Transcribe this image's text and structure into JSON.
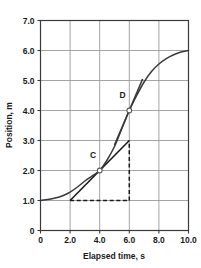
{
  "chart_data": {
    "type": "line",
    "title": "",
    "xlabel": "Elapsed time, s",
    "ylabel": "Position, m",
    "xlim": [
      0,
      10
    ],
    "ylim": [
      0,
      7
    ],
    "grid": true,
    "legend": null,
    "xticks": [
      0,
      2.0,
      4.0,
      6.0,
      8.0,
      10.0
    ],
    "xtick_labels": [
      "0",
      "2.0",
      "4.0",
      "6.0",
      "8.0",
      "10.0"
    ],
    "yticks": [
      0,
      1.0,
      2.0,
      3.0,
      4.0,
      5.0,
      6.0,
      7.0
    ],
    "ytick_labels": [
      "0",
      "1.0",
      "2.0",
      "3.0",
      "4.0",
      "5.0",
      "6.0",
      "7.0"
    ],
    "series": [
      {
        "name": "position-curve",
        "type": "line",
        "color": "#3a3a3a",
        "x": [
          0.0,
          0.5,
          1.0,
          1.5,
          2.0,
          2.5,
          3.0,
          3.5,
          4.0,
          4.5,
          5.0,
          5.5,
          6.0,
          6.5,
          7.0,
          7.5,
          8.0,
          8.5,
          9.0,
          9.5,
          10.0
        ],
        "y": [
          1.0,
          1.03,
          1.08,
          1.16,
          1.28,
          1.45,
          1.65,
          1.82,
          2.0,
          2.35,
          2.8,
          3.4,
          4.0,
          4.5,
          4.95,
          5.3,
          5.55,
          5.73,
          5.86,
          5.95,
          6.0
        ]
      }
    ],
    "annotations": [
      {
        "name": "point-C",
        "label": "C",
        "x": 4.0,
        "y": 2.0,
        "marker": "open-circle",
        "label_dx": -0.45,
        "label_dy": 0.42
      },
      {
        "name": "point-D",
        "label": "D",
        "x": 6.0,
        "y": 4.0,
        "marker": "open-circle",
        "label_dx": -0.45,
        "label_dy": 0.42
      }
    ],
    "construction_lines": [
      {
        "name": "tangent-line-at-C",
        "style": "solid",
        "color": "#1a1a1a",
        "points": [
          [
            2.0,
            1.0
          ],
          [
            6.0,
            3.0
          ]
        ]
      },
      {
        "name": "tangent-line-at-D",
        "style": "solid",
        "color": "#3a3a3a",
        "points": [
          [
            5.0,
            2.85
          ],
          [
            6.9,
            5.05
          ]
        ]
      },
      {
        "name": "rise-run-horizontal-dashed",
        "style": "dashed",
        "color": "#1a1a1a",
        "points": [
          [
            2.0,
            1.0
          ],
          [
            6.0,
            1.0
          ]
        ]
      },
      {
        "name": "rise-run-vertical-dashed",
        "style": "dashed",
        "color": "#1a1a1a",
        "points": [
          [
            6.0,
            1.0
          ],
          [
            6.0,
            3.0
          ]
        ]
      }
    ]
  },
  "axes": {
    "x_title": "Elapsed time, s",
    "y_title": "Position, m"
  },
  "colors": {
    "grid": "#9a9a9a",
    "axis": "#3a3a3a",
    "curve": "#3a3a3a",
    "tangent": "#1a1a1a",
    "background": "#ffffff",
    "text": "#1a1a1a"
  }
}
